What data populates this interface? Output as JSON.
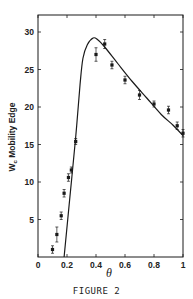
{
  "chart_data": {
    "type": "scatter",
    "title": "",
    "caption": "FIGURE 2",
    "xlabel": "θ",
    "ylabel_main": "W",
    "ylabel_sub": "c",
    "ylabel_rest": " Mobility Edge",
    "xlim": [
      0,
      1
    ],
    "ylim": [
      0,
      32
    ],
    "xticks": [
      0,
      0.2,
      0.4,
      0.6,
      0.8,
      1
    ],
    "xtick_labels": [
      "0",
      "0.2",
      "0.4",
      "0.6",
      "0.8",
      "1"
    ],
    "yticks": [
      5,
      10,
      15,
      20,
      25,
      30
    ],
    "ytick_labels": [
      "5",
      "10",
      "15",
      "20",
      "25",
      "30"
    ],
    "grid": false,
    "series": [
      {
        "name": "data points",
        "kind": "scatter_errorbar",
        "points": [
          {
            "x": 0.1,
            "y": 1.0,
            "err": 0.5
          },
          {
            "x": 0.13,
            "y": 3.0,
            "err": 1.0
          },
          {
            "x": 0.16,
            "y": 5.5,
            "err": 0.5
          },
          {
            "x": 0.18,
            "y": 8.5,
            "err": 0.5
          },
          {
            "x": 0.21,
            "y": 10.6,
            "err": 0.5
          },
          {
            "x": 0.23,
            "y": 11.6,
            "err": 0.4
          },
          {
            "x": 0.26,
            "y": 15.4,
            "err": 0.4
          },
          {
            "x": 0.4,
            "y": 27.0,
            "err": 0.9
          },
          {
            "x": 0.46,
            "y": 28.4,
            "err": 0.6
          },
          {
            "x": 0.51,
            "y": 25.6,
            "err": 0.5
          },
          {
            "x": 0.6,
            "y": 23.6,
            "err": 0.5
          },
          {
            "x": 0.7,
            "y": 21.6,
            "err": 0.6
          },
          {
            "x": 0.8,
            "y": 20.4,
            "err": 0.4
          },
          {
            "x": 0.9,
            "y": 19.6,
            "err": 0.5
          },
          {
            "x": 0.96,
            "y": 17.5,
            "err": 0.5
          },
          {
            "x": 1.0,
            "y": 16.5,
            "err": 0.5
          }
        ]
      },
      {
        "name": "theory curve",
        "kind": "line",
        "points": [
          {
            "x": 0.18,
            "y": 0
          },
          {
            "x": 0.22,
            "y": 8
          },
          {
            "x": 0.26,
            "y": 16
          },
          {
            "x": 0.29,
            "y": 23
          },
          {
            "x": 0.31,
            "y": 26.5
          },
          {
            "x": 0.34,
            "y": 28.3
          },
          {
            "x": 0.38,
            "y": 29.2
          },
          {
            "x": 0.41,
            "y": 29.0
          },
          {
            "x": 0.46,
            "y": 28.0
          },
          {
            "x": 0.55,
            "y": 25.8
          },
          {
            "x": 0.65,
            "y": 23.4
          },
          {
            "x": 0.75,
            "y": 21.2
          },
          {
            "x": 0.85,
            "y": 19.0
          },
          {
            "x": 0.93,
            "y": 17.6
          },
          {
            "x": 1.0,
            "y": 16.2
          }
        ]
      }
    ],
    "colors": {
      "ink": "#1a1a1a",
      "background": "#ffffff"
    }
  }
}
